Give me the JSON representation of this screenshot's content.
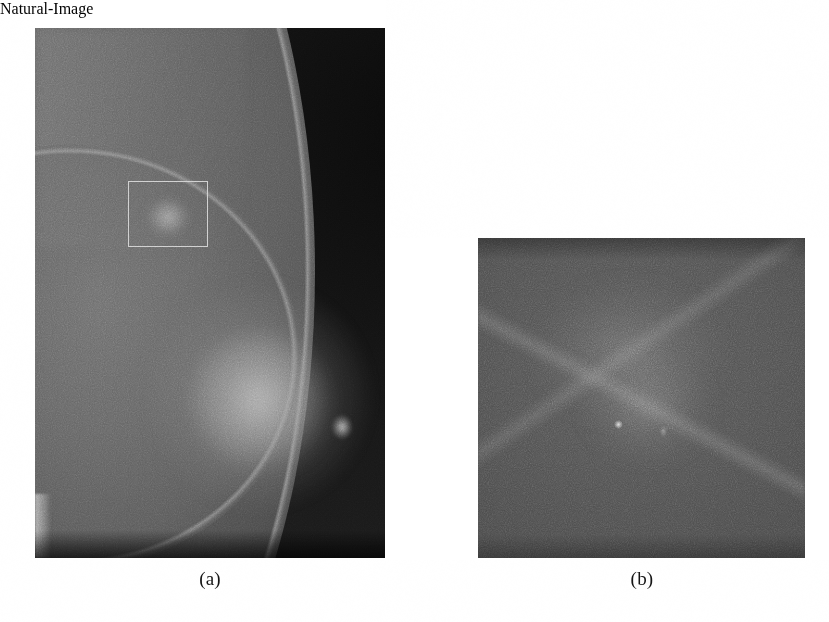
{
  "figure": {
    "background_color": "#ffffff",
    "panels": [
      {
        "id": "panel-a",
        "caption": "(a)",
        "kind": "mammogram-full-view",
        "description": "Full-field mammogram of a breast with a region of interest outlined",
        "frame": {
          "x": 35,
          "y": 28,
          "width": 350,
          "height": 530
        },
        "annotation": {
          "name": "region-of-interest-box",
          "shape": "rectangle",
          "x": 128,
          "y": 181,
          "width": 80,
          "height": 66,
          "stroke_color": "#cdcdcd"
        },
        "tones": {
          "air_background": "#111111",
          "tissue_mid": "#5a5a5a",
          "dense_tissue": "#9a9a9a"
        }
      },
      {
        "id": "panel-b",
        "caption": "(b)",
        "kind": "mammogram-roi-crop",
        "description": "Magnified view of the outlined region of interest",
        "frame": {
          "x": 478,
          "y": 238,
          "width": 327,
          "height": 320
        },
        "tones": {
          "base": "#4d4d4d",
          "diffuse_bright": "#8a8a8a",
          "bright_dot": "#e1e1e1"
        }
      }
    ]
  },
  "captions": {
    "a": "(a)",
    "b": "(b)"
  }
}
